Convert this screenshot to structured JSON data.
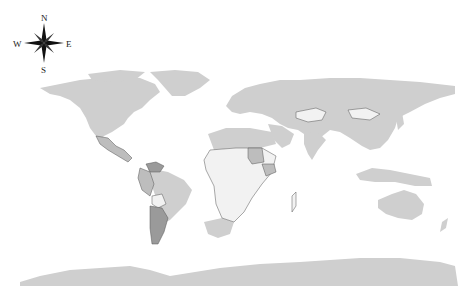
{
  "map": {
    "type": "choropleth world map",
    "compass": {
      "north": "N",
      "south": "S",
      "east": "E",
      "west": "W"
    },
    "colors": {
      "background": "#ffffff",
      "default_land": "#cfcfcf",
      "light_fill": "#f2f2f2",
      "mid_fill": "#bdbdbd",
      "dark_fill": "#9a9a9a",
      "border": "#555555"
    },
    "highlighted_regions": [
      {
        "name": "Mexico",
        "shade": "mid"
      },
      {
        "name": "Venezuela",
        "shade": "dark"
      },
      {
        "name": "Colombia",
        "shade": "mid"
      },
      {
        "name": "Peru",
        "shade": "mid"
      },
      {
        "name": "Bolivia",
        "shade": "light"
      },
      {
        "name": "Argentina",
        "shade": "dark"
      },
      {
        "name": "Sudan",
        "shade": "mid"
      },
      {
        "name": "Ethiopia",
        "shade": "mid"
      },
      {
        "name": "South Africa",
        "shade": "default"
      },
      {
        "name": "Kazakhstan",
        "shade": "light"
      },
      {
        "name": "Mongolia",
        "shade": "light"
      }
    ]
  }
}
